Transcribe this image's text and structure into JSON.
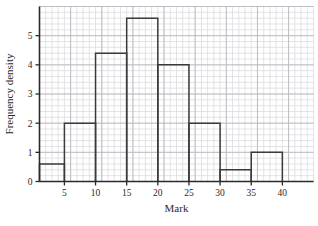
{
  "chart_data": {
    "type": "bar",
    "title": "",
    "subtitle": "",
    "xlabel": "Mark",
    "ylabel": "Frequency density",
    "bin_edges": [
      1,
      5,
      10,
      15,
      20,
      25,
      30,
      35,
      40
    ],
    "categories": [
      "1-5",
      "5-10",
      "10-15",
      "15-20",
      "20-25",
      "25-30",
      "30-35",
      "35-40"
    ],
    "values": [
      0.6,
      2.0,
      4.4,
      5.6,
      4.0,
      2.0,
      0.4,
      1.0
    ],
    "xlim": [
      1,
      45
    ],
    "ylim": [
      0,
      6
    ],
    "xticks": [
      5,
      10,
      15,
      20,
      25,
      30,
      35,
      40
    ],
    "xtick_labels": [
      "5",
      "10",
      "15",
      "20",
      "25",
      "30",
      "35",
      "40"
    ],
    "yticks": [
      0,
      1,
      2,
      3,
      4,
      5
    ],
    "ytick_labels": [
      "0",
      "1",
      "2",
      "3",
      "4",
      "5"
    ],
    "grid": true,
    "grid_major_step_x": 5,
    "grid_minor_step_x": 1,
    "grid_major_step_y": 1,
    "grid_minor_step_y": 0.2,
    "legend": null,
    "legend_position": "none",
    "annotations": [],
    "colors": {
      "bar_outline": "#3a3a3a",
      "bar_fill": "none",
      "axis": "#2a2a2a",
      "grid_minor": "#d8d8dc",
      "grid_major": "#b9b9c0",
      "background": "#ffffff",
      "text": "#2a2a2a"
    }
  }
}
